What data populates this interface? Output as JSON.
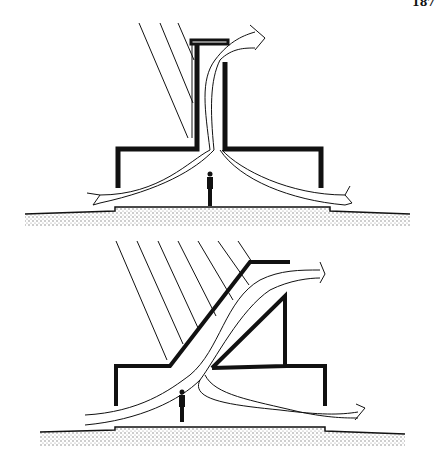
{
  "page_number": "187",
  "figure": {
    "panels": [
      {
        "id": "top",
        "description": "Vertical solar chimney: sun rays heat a tall shaft; air drawn in from both sides exits at top",
        "elements": [
          "sun-rays",
          "chimney",
          "airflow-arrows",
          "person",
          "ground"
        ]
      },
      {
        "id": "bottom",
        "description": "Inclined solar collector chimney: sun rays heat sloped duct; air drawn in and exits at top",
        "elements": [
          "sun-rays",
          "inclined-duct",
          "airflow-arrows",
          "person",
          "ground"
        ]
      }
    ],
    "colors": {
      "ink": "#111111",
      "paper": "#ffffff",
      "ground": "#9a9a9a"
    }
  }
}
